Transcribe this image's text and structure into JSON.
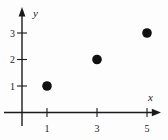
{
  "figure": {
    "background": "#fdfdfd",
    "line_color": "#1b1b1b"
  },
  "chart_data": {
    "type": "scatter",
    "title": "",
    "xlabel": "x",
    "ylabel": "y",
    "points": [
      {
        "x": 1,
        "y": 1
      },
      {
        "x": 3,
        "y": 2
      },
      {
        "x": 5,
        "y": 3
      }
    ],
    "x_ticks": [
      1,
      3,
      5
    ],
    "y_ticks": [
      1,
      2,
      3
    ],
    "xlim": [
      0,
      5.6
    ],
    "ylim": [
      0,
      3.7
    ],
    "grid": false,
    "legend_position": "none",
    "marker": {
      "shape": "circle",
      "color": "#111111"
    }
  }
}
